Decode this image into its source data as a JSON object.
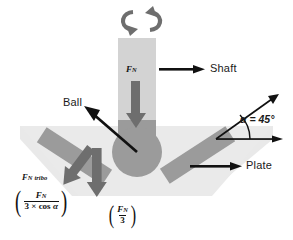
{
  "diagram": {
    "labels": {
      "shaft": "Shaft",
      "ball": "Ball",
      "plate": "Plate",
      "angle": "α = 45°",
      "normal_force": "F",
      "normal_force_sub": "N",
      "tribo_force_main": "F",
      "tribo_force_sub": "N",
      "tribo_force_word": "tribo"
    },
    "formulas": {
      "tribo": {
        "numerator_main": "F",
        "numerator_sub": "N",
        "denominator_number": "3 × cos ",
        "denominator_symbol": "α",
        "open_paren": "(",
        "close_paren": ")"
      },
      "axial": {
        "numerator_main": "F",
        "numerator_sub": "N",
        "denominator": "3",
        "open_paren": "(",
        "close_paren": ")"
      }
    },
    "icons": {
      "rotation": "rotation-arrows-icon",
      "down_arrow": "normal-force-arrow-icon",
      "tribo_arrow": "tribo-force-arrow-icon",
      "axial_arrow": "axial-force-arrow-icon",
      "ball_pointer": "ball-callout-arrow-icon",
      "shaft_pointer": "shaft-callout-arrow-icon",
      "plate_pointer": "plate-callout-arrow-icon",
      "angle_arc": "angle-arc-icon"
    },
    "colors": {
      "shaft_light": "#d2d2d2",
      "part_gray": "#9a9a9a",
      "backdrop": "#e8e8e8",
      "arrow_dark": "#6e6e6e",
      "line_black": "#111111",
      "background": "#ffffff"
    },
    "geometry": {
      "angle_degrees": 45,
      "ball_center_x": 137,
      "ball_center_y": 152,
      "ball_radius": 24,
      "angle_vertex_x": 216,
      "angle_vertex_y": 139
    }
  }
}
